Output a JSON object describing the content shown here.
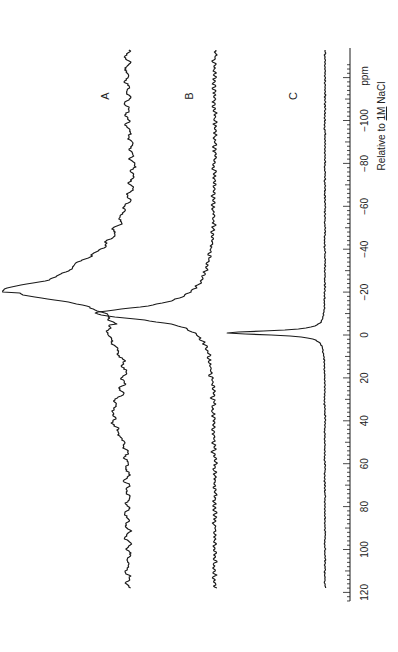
{
  "chart_data": {
    "type": "line",
    "title": "",
    "orientation": "rotated-90-ccw",
    "xlabel": "ppm",
    "xlabel_note": "Relative to 1M NaCl",
    "x_ticks": [
      120,
      100,
      80,
      60,
      40,
      20,
      0,
      -20,
      -40,
      -60,
      -80,
      -100
    ],
    "x_tick_labels": [
      "120",
      "100",
      "80",
      "60",
      "40",
      "20",
      "0",
      "−20",
      "−40",
      "−60",
      "−80",
      "−100"
    ],
    "xlim": [
      130,
      -128
    ],
    "grid": false,
    "legend": "inline labels",
    "series": [
      {
        "name": "A",
        "baseline_offset": 0,
        "peak_ppm": -20,
        "peak_height": 112,
        "peak_width_ppm": 22,
        "description": "broad asymmetric peak near -20 ppm with shoulder near -33 ppm, noisy baseline with broad hump 30-50 ppm and dip near -60 to -100 ppm"
      },
      {
        "name": "B",
        "baseline_offset": 0,
        "peak_ppm": -10,
        "peak_height": 104,
        "peak_width_ppm": 10,
        "description": "narrower peak near -10 ppm, noisy flat baseline"
      },
      {
        "name": "C",
        "baseline_offset": 0,
        "peak_ppm": -1,
        "peak_height": 98,
        "peak_width_ppm": 2.5,
        "description": "sharp narrow peak near -1 ppm, quiet flat baseline"
      }
    ]
  },
  "labels": {
    "A": "A",
    "B": "B",
    "C": "C",
    "unit": "ppm",
    "reference_prefix": "Relative to ",
    "reference_conc": "1M",
    "reference_suffix": " NaCl"
  }
}
